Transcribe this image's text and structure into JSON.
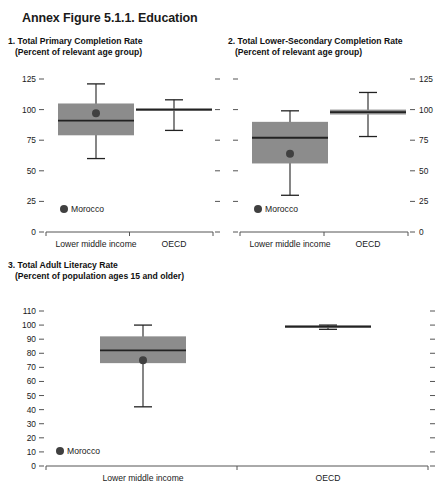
{
  "figure": {
    "title": "Annex Figure 5.1.1. Education"
  },
  "legend": {
    "marker_label": "Morocco",
    "marker_color": "#404040"
  },
  "style": {
    "box_fill": "#8c8c8c",
    "line_color": "#222222",
    "axis_color": "#555555"
  },
  "panels": [
    {
      "id": "panel-1",
      "number": "1.",
      "title": "Total Primary Completion Rate",
      "subtitle": "(Percent of relevant age group)",
      "axis_side": "left",
      "chart_data": {
        "type": "box",
        "title": "1. Total Primary Completion Rate",
        "subtitle": "(Percent of relevant age group)",
        "xlabel": "",
        "ylabel": "Percent of relevant age group",
        "ylim": [
          0,
          125
        ],
        "yticks": [
          0,
          25,
          50,
          75,
          100,
          125
        ],
        "ytick_labels": [
          "0",
          "25",
          "50",
          "75",
          "100",
          "125"
        ],
        "grid": false,
        "legend": "Morocco",
        "legend_position": "bottom-left",
        "categories": [
          "Lower middle income",
          "OECD"
        ],
        "boxes": [
          {
            "category": "Lower middle income",
            "whisker_low": 60,
            "q1": 79,
            "median": 91,
            "q3": 105,
            "whisker_high": 121,
            "point_label": "Morocco",
            "point_value": 97
          },
          {
            "category": "OECD",
            "whisker_low": 83,
            "q1": 99,
            "median": 100,
            "q3": 101,
            "whisker_high": 108,
            "point_label": null,
            "point_value": null
          }
        ]
      }
    },
    {
      "id": "panel-2",
      "number": "2.",
      "title": "Total Lower-Secondary Completion Rate",
      "subtitle": "(Percent of relevant age group)",
      "axis_side": "right",
      "chart_data": {
        "type": "box",
        "title": "2. Total Lower-Secondary Completion Rate",
        "subtitle": "(Percent of relevant age group)",
        "xlabel": "",
        "ylabel": "Percent of relevant age group",
        "ylim": [
          0,
          125
        ],
        "yticks": [
          0,
          25,
          50,
          75,
          100,
          125
        ],
        "ytick_labels": [
          "0",
          "25",
          "50",
          "75",
          "100",
          "125"
        ],
        "grid": false,
        "legend": "Morocco",
        "legend_position": "bottom-left",
        "categories": [
          "Lower middle income",
          "OECD"
        ],
        "boxes": [
          {
            "category": "Lower middle income",
            "whisker_low": 30,
            "q1": 56,
            "median": 77,
            "q3": 90,
            "whisker_high": 99,
            "point_label": "Morocco",
            "point_value": 64
          },
          {
            "category": "OECD",
            "whisker_low": 78,
            "q1": 96,
            "median": 98,
            "q3": 100,
            "whisker_high": 114,
            "point_label": null,
            "point_value": null
          }
        ]
      }
    },
    {
      "id": "panel-3",
      "number": "3.",
      "title": "Total Adult Literacy Rate",
      "subtitle": "(Percent of population ages 15 and older)",
      "axis_side": "left",
      "chart_data": {
        "type": "box",
        "title": "3. Total Adult Literacy Rate",
        "subtitle": "(Percent of population ages 15 and older)",
        "xlabel": "",
        "ylabel": "Percent of population ages 15 and older",
        "ylim": [
          0,
          110
        ],
        "yticks": [
          0,
          10,
          20,
          30,
          40,
          50,
          60,
          70,
          80,
          90,
          100,
          110
        ],
        "ytick_labels": [
          "0",
          "10",
          "20",
          "30",
          "40",
          "50",
          "60",
          "70",
          "80",
          "90",
          "100",
          "110"
        ],
        "grid": false,
        "legend": "Morocco",
        "legend_position": "bottom-left",
        "categories": [
          "Lower middle income",
          "OECD"
        ],
        "boxes": [
          {
            "category": "Lower middle income",
            "whisker_low": 42,
            "q1": 73,
            "median": 82,
            "q3": 92,
            "whisker_high": 100,
            "point_label": "Morocco",
            "point_value": 75
          },
          {
            "category": "OECD",
            "whisker_low": 97,
            "q1": 98,
            "median": 99,
            "q3": 99.5,
            "whisker_high": 100,
            "point_label": null,
            "point_value": null
          }
        ]
      }
    }
  ]
}
